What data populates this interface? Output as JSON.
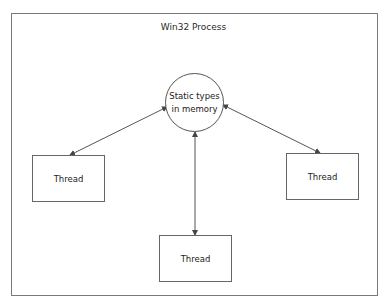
{
  "diagram": {
    "title": "Win32 Process",
    "center_node": {
      "line1": "Static types",
      "line2": "in memory",
      "shape": "circle"
    },
    "threads": [
      {
        "id": "left",
        "label": "Thread"
      },
      {
        "id": "right",
        "label": "Thread"
      },
      {
        "id": "bottom",
        "label": "Thread"
      }
    ],
    "edges": [
      {
        "from": "center_node",
        "to": "left",
        "type": "bidirectional-arrow"
      },
      {
        "from": "center_node",
        "to": "right",
        "type": "bidirectional-arrow"
      },
      {
        "from": "center_node",
        "to": "bottom",
        "type": "bidirectional-arrow"
      }
    ],
    "colors": {
      "stroke": "#555555",
      "frame": "#7a7a7a",
      "text": "#222222",
      "background": "#ffffff"
    }
  }
}
